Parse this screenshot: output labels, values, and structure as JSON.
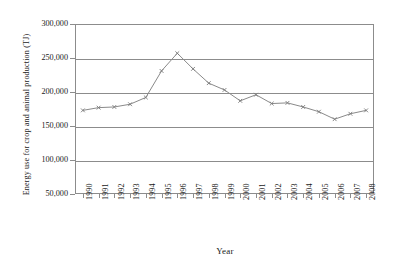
{
  "chart_data": {
    "type": "line",
    "title": "",
    "xlabel": "Year",
    "ylabel": "Energy use for crop and animal production (TJ)",
    "categories": [
      "1990",
      "1991",
      "1992",
      "1993",
      "1994",
      "1995",
      "1996",
      "1997",
      "1998",
      "1999",
      "2000",
      "2001",
      "2002",
      "2003",
      "2004",
      "2005",
      "2006",
      "2007",
      "2008"
    ],
    "values": [
      173000,
      177000,
      178000,
      182000,
      192000,
      231000,
      257000,
      234000,
      213000,
      203000,
      187000,
      196000,
      183000,
      184000,
      178000,
      171000,
      160000,
      168000,
      173000
    ],
    "series": [
      {
        "name": "Energy use for crop and animal production",
        "values": [
          173000,
          177000,
          178000,
          182000,
          192000,
          231000,
          257000,
          234000,
          213000,
          203000,
          187000,
          196000,
          183000,
          184000,
          178000,
          171000,
          160000,
          168000,
          173000
        ]
      }
    ],
    "ylim": [
      50000,
      300000
    ],
    "ytick_labels": [
      "300,000",
      "250,000",
      "200,000",
      "150,000",
      "100,000",
      "50,000"
    ],
    "ytick_values": [
      300000,
      250000,
      200000,
      150000,
      100000,
      50000
    ],
    "grid": true,
    "legend": "none",
    "line_color": "#8a8a8a",
    "marker_color": "#7a7a7a",
    "axis_color": "#8c8c8c",
    "marker_style": "x"
  }
}
